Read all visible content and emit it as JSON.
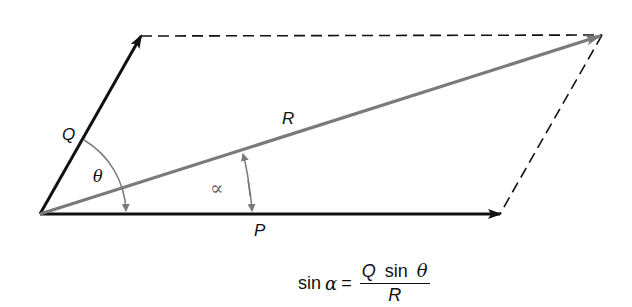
{
  "diagram": {
    "type": "parallelogram-of-forces",
    "labels": {
      "P": "P",
      "Q": "Q",
      "R": "R",
      "theta": "θ",
      "alpha": "∝"
    },
    "colors": {
      "force_vectors": "#111111",
      "resultant": "#7a7a7a",
      "construction_lines": "#111111",
      "angle_arcs": "#7a7a7a"
    },
    "points": {
      "origin": [
        40,
        214
      ],
      "Q_tip": [
        141,
        36
      ],
      "R_tip": [
        602,
        35
      ],
      "P_tip": [
        500,
        214
      ]
    },
    "formula": {
      "lhs_func": "sin",
      "lhs_var": "α",
      "equals": "=",
      "numerator_Q": "Q",
      "numerator_func": "sin",
      "numerator_var": "θ",
      "denominator": "R"
    }
  }
}
